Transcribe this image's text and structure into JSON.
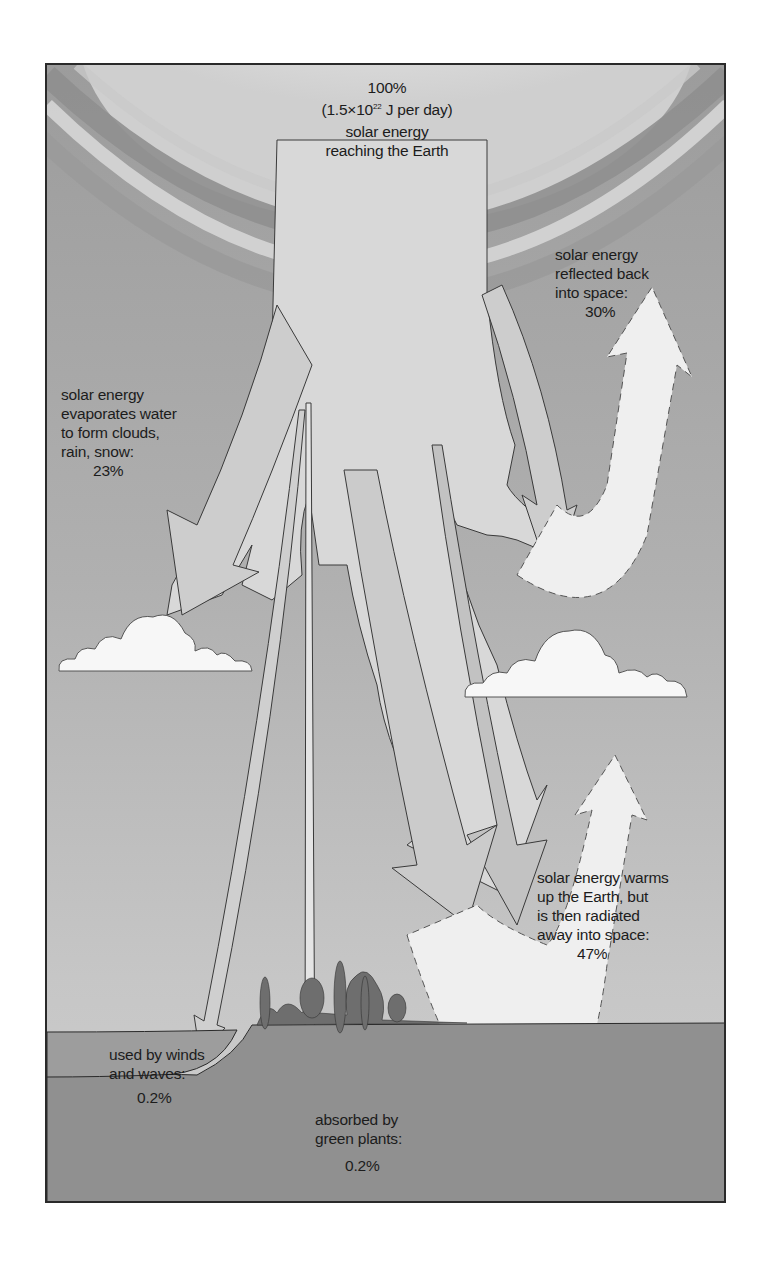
{
  "diagram": {
    "title_percent": "100%",
    "title_energy_prefix": "(1.5×10",
    "title_energy_exp": "22",
    "title_energy_suffix": " J per day)",
    "title_lines": [
      "solar energy",
      "reaching the Earth"
    ],
    "reflected": {
      "lines": [
        "solar energy",
        "reflected back",
        "into space:"
      ],
      "percent": "30%"
    },
    "evaporates": {
      "lines": [
        "solar energy",
        "evaporates water",
        "to form clouds,",
        "rain, snow:"
      ],
      "percent": "23%"
    },
    "warms": {
      "lines": [
        "solar energy warms",
        "up the Earth, but",
        "is then radiated",
        "away into space:"
      ],
      "percent": "47%"
    },
    "winds": {
      "lines": [
        "used by winds",
        "and waves:"
      ],
      "percent": "0.2%"
    },
    "plants": {
      "lines": [
        "absorbed by",
        "green plants:"
      ],
      "percent": "0.2%"
    },
    "colors": {
      "sky_dark": "#9a9a9a",
      "sky_light": "#bdbdbd",
      "sun_glow": "#e8e8e8",
      "arrow_fill": "#d6d6d6",
      "return_arrow_fill": "#efefef",
      "ground": "#8f8f8f",
      "vegetation": "#6e6e6e",
      "cloud": "#f7f7f7"
    }
  }
}
